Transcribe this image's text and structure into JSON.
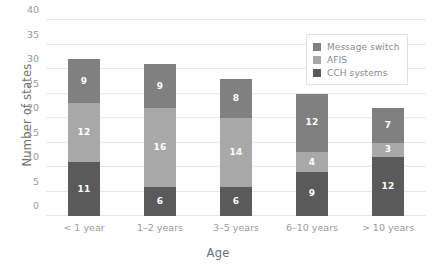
{
  "chart_data": {
    "type": "bar",
    "subtype": "stacked-bar",
    "title": "",
    "xlabel": "Age",
    "ylabel": "Number of states",
    "categories": [
      "< 1 year",
      "1–2 years",
      "3–5 years",
      "6–10 years",
      "> 10 years"
    ],
    "series": [
      {
        "name": "CCH systems",
        "values": [
          11,
          6,
          6,
          9,
          12
        ],
        "color": "#5a5a5a"
      },
      {
        "name": "AFIS",
        "values": [
          12,
          16,
          14,
          4,
          3
        ],
        "color": "#a8a8a8"
      },
      {
        "name": "Message switch",
        "values": [
          9,
          9,
          8,
          12,
          7
        ],
        "color": "#808080"
      }
    ],
    "stack_order_bottom_to_top": [
      "CCH systems",
      "AFIS",
      "Message switch"
    ],
    "totals": [
      32,
      31,
      28,
      25,
      22
    ],
    "ylim": [
      0,
      40
    ],
    "ytick_labels": [
      "0",
      "5",
      "10",
      "15",
      "20",
      "25",
      "30",
      "35",
      "40"
    ],
    "ytick_values": [
      0,
      5,
      10,
      15,
      20,
      25,
      30,
      35,
      40
    ],
    "grid": "horizontal",
    "legend_position": "top-right",
    "legend_order_top_to_bottom": [
      "Message switch",
      "AFIS",
      "CCH systems"
    ],
    "data_labels": true,
    "background_color": "#ffffff",
    "grid_color": "#e8e8e8",
    "tick_label_color": "#9a9a9a",
    "axis_title_color": "#707070"
  },
  "legend": {
    "entries": [
      {
        "label": "Message switch",
        "color": "#808080"
      },
      {
        "label": "AFIS",
        "color": "#a8a8a8"
      },
      {
        "label": "CCH systems",
        "color": "#5a5a5a"
      }
    ]
  }
}
